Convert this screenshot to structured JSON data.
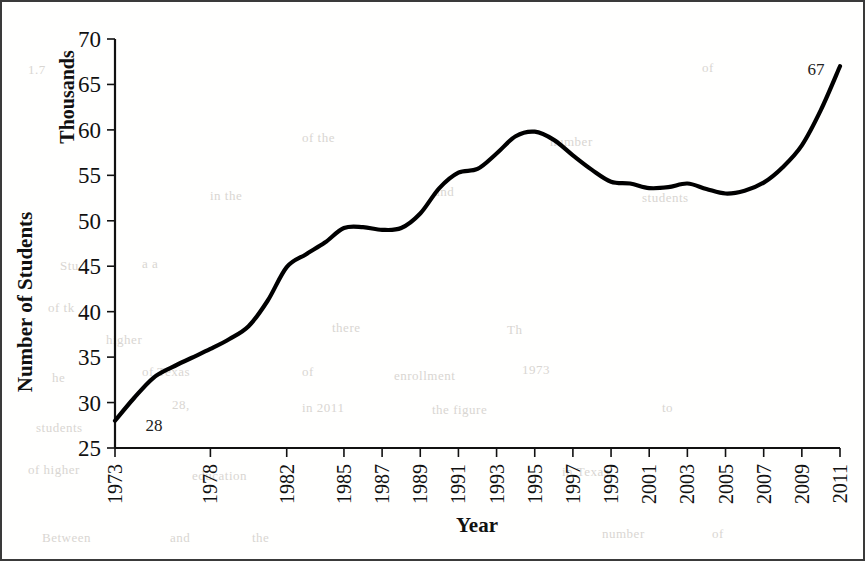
{
  "figure": {
    "border_color": "#3a3a3a",
    "background": "#ffffff",
    "line_color": "#000000"
  },
  "labels": {
    "ylabel": "Number of Students",
    "yunit": "Thousands",
    "xlabel": "Year",
    "first_point_label": "28",
    "last_point_label": "67"
  },
  "bleed_text": [
    {
      "text": "of the",
      "x": 300,
      "y": 128
    },
    {
      "text": "number",
      "x": 548,
      "y": 132
    },
    {
      "text": "in the",
      "x": 208,
      "y": 186
    },
    {
      "text": "and",
      "x": 432,
      "y": 182
    },
    {
      "text": "students",
      "x": 640,
      "y": 188
    },
    {
      "text": "a a",
      "x": 140,
      "y": 254
    },
    {
      "text": "Stu",
      "x": 58,
      "y": 256
    },
    {
      "text": "of tk",
      "x": 46,
      "y": 298
    },
    {
      "text": "there",
      "x": 330,
      "y": 318
    },
    {
      "text": "higher",
      "x": 104,
      "y": 330
    },
    {
      "text": "Th",
      "x": 505,
      "y": 320
    },
    {
      "text": "of Texas",
      "x": 140,
      "y": 362
    },
    {
      "text": "of",
      "x": 300,
      "y": 362
    },
    {
      "text": "enrollment",
      "x": 392,
      "y": 366
    },
    {
      "text": "1973",
      "x": 520,
      "y": 360
    },
    {
      "text": "he",
      "x": 50,
      "y": 368
    },
    {
      "text": "28,",
      "x": 170,
      "y": 395
    },
    {
      "text": "in 2011",
      "x": 300,
      "y": 398
    },
    {
      "text": "the figure",
      "x": 430,
      "y": 400
    },
    {
      "text": "students",
      "x": 34,
      "y": 418
    },
    {
      "text": "to",
      "x": 660,
      "y": 398
    },
    {
      "text": "of higher",
      "x": 26,
      "y": 460
    },
    {
      "text": "education",
      "x": 190,
      "y": 466
    },
    {
      "text": "in Texas",
      "x": 560,
      "y": 462
    },
    {
      "text": "Between",
      "x": 40,
      "y": 528
    },
    {
      "text": "and",
      "x": 168,
      "y": 528
    },
    {
      "text": "the",
      "x": 250,
      "y": 528
    },
    {
      "text": "number",
      "x": 600,
      "y": 524
    },
    {
      "text": "of",
      "x": 710,
      "y": 524
    },
    {
      "text": "1.7",
      "x": 26,
      "y": 60
    },
    {
      "text": "of",
      "x": 700,
      "y": 58
    }
  ],
  "chart_data": {
    "type": "line",
    "title": "",
    "xlabel": "Year",
    "ylabel": "Number of Students",
    "yunit": "Thousands",
    "xlim": [
      1973,
      2011
    ],
    "ylim": [
      25,
      70
    ],
    "yticks": [
      25,
      30,
      35,
      40,
      45,
      50,
      55,
      60,
      65,
      70
    ],
    "xtick_labels": [
      "1973",
      "1978",
      "1982",
      "1985",
      "1987",
      "1989",
      "1991",
      "1993",
      "1995",
      "1997",
      "1999",
      "2001",
      "2003",
      "2005",
      "2007",
      "2009",
      "2011"
    ],
    "grid": false,
    "legend": false,
    "annotations": [
      {
        "text": "28",
        "x": 1973,
        "y": 28
      },
      {
        "text": "67",
        "x": 2011,
        "y": 67
      }
    ],
    "series": [
      {
        "name": "Number of Students",
        "x": [
          1973,
          1974,
          1975,
          1976,
          1977,
          1978,
          1979,
          1980,
          1981,
          1982,
          1983,
          1984,
          1985,
          1986,
          1987,
          1988,
          1989,
          1990,
          1991,
          1992,
          1993,
          1994,
          1995,
          1996,
          1997,
          1998,
          1999,
          2000,
          2001,
          2002,
          2003,
          2004,
          2005,
          2006,
          2007,
          2008,
          2009,
          2010,
          2011
        ],
        "y": [
          28.0,
          30.5,
          32.7,
          33.9,
          34.9,
          35.9,
          37.0,
          38.4,
          41.2,
          44.9,
          46.3,
          47.6,
          49.2,
          49.3,
          49.0,
          49.2,
          50.8,
          53.6,
          55.3,
          55.7,
          57.4,
          59.3,
          59.8,
          58.9,
          57.2,
          55.6,
          54.3,
          54.1,
          53.6,
          53.7,
          54.1,
          53.5,
          53.0,
          53.3,
          54.2,
          55.9,
          58.3,
          62.2,
          67.0
        ]
      }
    ]
  }
}
